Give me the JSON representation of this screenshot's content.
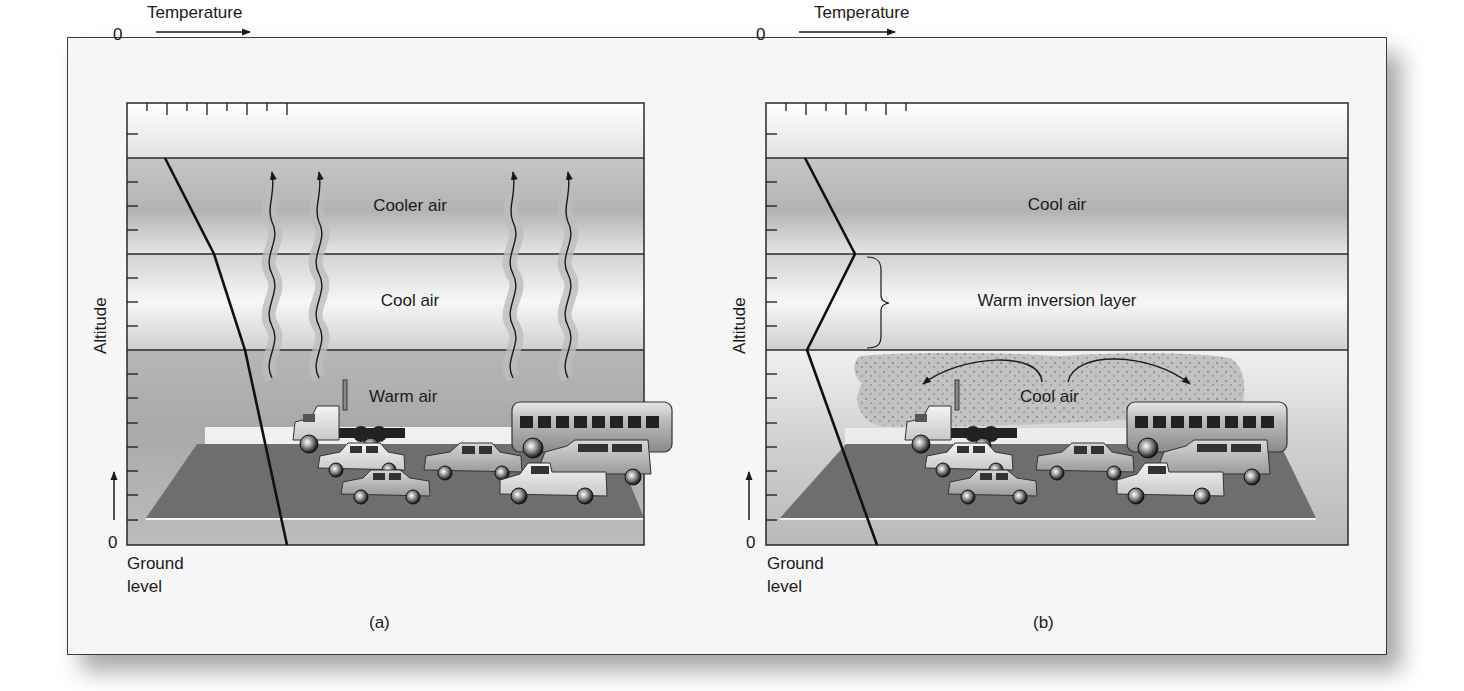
{
  "figure": {
    "panels": [
      {
        "id": "a",
        "caption": "(a)",
        "x_axis_label": "Temperature",
        "x_origin": "0",
        "y_axis_label": "Altitude",
        "y_origin": "0",
        "ground_label_line1": "Ground",
        "ground_label_line2": "level",
        "layers": [
          {
            "label": "Cooler air"
          },
          {
            "label": "Cool air"
          },
          {
            "label": "Warm air"
          }
        ],
        "temperature_profile": "decreasing with altitude"
      },
      {
        "id": "b",
        "caption": "(b)",
        "x_axis_label": "Temperature",
        "x_origin": "0",
        "y_axis_label": "Altitude",
        "y_origin": "0",
        "ground_label_line1": "Ground",
        "ground_label_line2": "level",
        "layers": [
          {
            "label": "Cool air"
          },
          {
            "label": "Warm inversion layer"
          },
          {
            "label": "Cool air"
          }
        ],
        "temperature_profile": "temperature inversion"
      }
    ],
    "colors": {
      "frame_bg": "#f6f6f6",
      "line": "#1a1a1a",
      "road": "#6e6e6e",
      "band_dark": "#b8b8b8",
      "band_light": "#f4f4f4"
    }
  }
}
